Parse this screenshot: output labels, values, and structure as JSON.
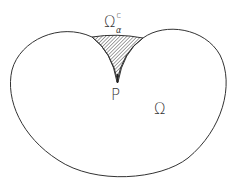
{
  "diagram": {
    "region_label": "Ω",
    "complement_label": {
      "base": "Ω",
      "superscript": "c",
      "subscript": "α"
    },
    "point_label": "P",
    "colors": {
      "stroke": "#333333",
      "hatch": "#555555",
      "background": "#ffffff"
    }
  }
}
